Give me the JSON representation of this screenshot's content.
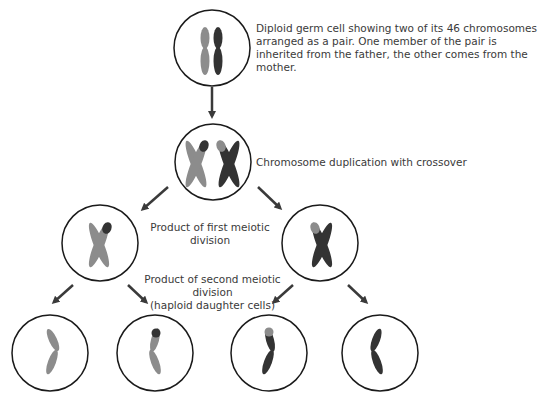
{
  "diagram": {
    "colors": {
      "paternal": "#8c8c8c",
      "maternal": "#333333",
      "outline": "#1a1a1a",
      "arrow": "#3a3a3a",
      "text": "#3a3a3a"
    },
    "labels": {
      "diploid": "Diploid germ cell showing two of its 46 chromosomes arranged as a pair. One member of the pair is inherited from the father, the other comes from the mother.",
      "duplication": "Chromosome duplication with crossover",
      "first_division": "Product of first meiotic division",
      "second_division_line1": "Product of second meiotic division",
      "second_division_line2": "(haploid daughter cells)"
    },
    "cells": [
      {
        "id": "diploid-germ-cell",
        "stage": "diploid"
      },
      {
        "id": "duplicated-cell",
        "stage": "duplication"
      },
      {
        "id": "first-division-left",
        "stage": "first-division"
      },
      {
        "id": "first-division-right",
        "stage": "first-division"
      },
      {
        "id": "daughter-cell-1",
        "stage": "haploid"
      },
      {
        "id": "daughter-cell-2",
        "stage": "haploid"
      },
      {
        "id": "daughter-cell-3",
        "stage": "haploid"
      },
      {
        "id": "daughter-cell-4",
        "stage": "haploid"
      }
    ]
  }
}
